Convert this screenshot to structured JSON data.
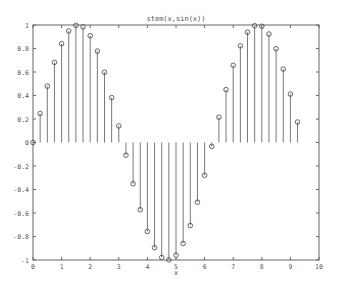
{
  "chart_data": {
    "type": "stem",
    "title": "stem(x,sin(x))",
    "xlabel": "x",
    "ylabel": "",
    "xlim": [
      0,
      10
    ],
    "ylim": [
      -1,
      1
    ],
    "xticks": [
      0,
      1,
      2,
      3,
      4,
      5,
      6,
      7,
      8,
      9,
      10
    ],
    "yticks": [
      -1,
      -0.8,
      -0.6,
      -0.4,
      -0.2,
      0,
      0.2,
      0.4,
      0.6,
      0.8,
      1
    ],
    "ytick_labels": [
      "-1",
      "-0.8",
      "-0.6",
      "-0.4",
      "-0.2",
      "0",
      "0.2",
      "0.4",
      "0.6",
      "0.8",
      "1"
    ],
    "grid": false,
    "marker": "circle",
    "colors": {
      "stem": "#777777",
      "axes": "#666666",
      "marker": "#555555"
    },
    "x": [
      0,
      0.25,
      0.5,
      0.75,
      1.0,
      1.25,
      1.5,
      1.75,
      2.0,
      2.25,
      2.5,
      2.75,
      3.0,
      3.25,
      3.5,
      3.75,
      4.0,
      4.25,
      4.5,
      4.75,
      5.0,
      5.25,
      5.5,
      5.75,
      6.0,
      6.25,
      6.5,
      6.75,
      7.0,
      7.25,
      7.5,
      7.75,
      8.0,
      8.25,
      8.5,
      8.75,
      9.0,
      9.25
    ],
    "y": [
      0,
      0.247,
      0.479,
      0.682,
      0.841,
      0.949,
      0.997,
      0.984,
      0.909,
      0.778,
      0.598,
      0.382,
      0.141,
      -0.108,
      -0.351,
      -0.572,
      -0.757,
      -0.895,
      -0.978,
      -0.999,
      -0.959,
      -0.859,
      -0.706,
      -0.508,
      -0.279,
      -0.033,
      0.215,
      0.45,
      0.657,
      0.823,
      0.938,
      0.994,
      0.989,
      0.923,
      0.798,
      0.625,
      0.412,
      0.174
    ]
  }
}
